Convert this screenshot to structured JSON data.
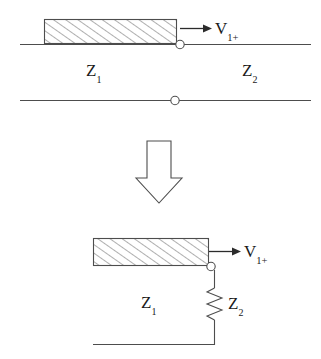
{
  "figure": {
    "stroke_color": "#4d4d4d",
    "text_color": "#1a1a1a",
    "hatch_color": "#6b6b6b",
    "background_color": "#ffffff"
  },
  "top_diagram": {
    "name": "transmission-line-two-section",
    "hatched_block_label": "Z1 line section",
    "labels": {
      "voltage": {
        "base": "V",
        "sub": "1+"
      },
      "impedance_left": {
        "base": "Z",
        "sub": "1"
      },
      "impedance_right": {
        "base": "Z",
        "sub": "2"
      }
    },
    "arrow_direction": "right",
    "terminals": 2
  },
  "transition": {
    "name": "downward-block-arrow",
    "direction": "down"
  },
  "bottom_diagram": {
    "name": "equivalent-lumped-circuit",
    "hatched_block_label": "Z1 line section",
    "labels": {
      "voltage": {
        "base": "V",
        "sub": "1+"
      },
      "impedance_line": {
        "base": "Z",
        "sub": "1"
      },
      "impedance_load": {
        "base": "Z",
        "sub": "2"
      }
    },
    "arrow_direction": "right",
    "load_element": "resistor-zigzag"
  }
}
